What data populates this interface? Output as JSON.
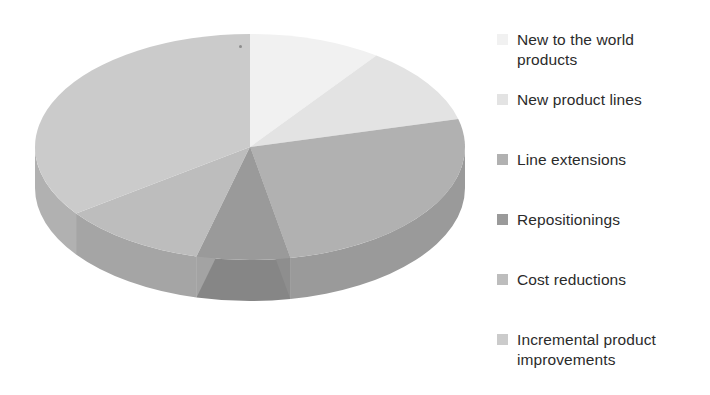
{
  "chart_data": {
    "type": "pie",
    "title": "",
    "subtitle": "",
    "xlabel": "",
    "ylabel": "",
    "style": "3d-exploded-disc",
    "legend_position": "right",
    "grid": false,
    "categories": [
      "New to the world products",
      "New product lines",
      "Line extensions",
      "Repositionings",
      "Cost reductions",
      "Incremental product improvements"
    ],
    "values": [
      10,
      11,
      26,
      7,
      11,
      35
    ],
    "units": "percent",
    "colors": [
      "#F1F1F1",
      "#E3E3E3",
      "#B1B1B1",
      "#9A9A9A",
      "#BDBDBD",
      "#CBCBCB"
    ],
    "side_colors": [
      "#D2D2D2",
      "#C6C6C6",
      "#9A9A9A",
      "#868686",
      "#A5A5A5",
      "#B1B1B1"
    ],
    "start_angle_deg": 0,
    "direction": "clockwise"
  },
  "legend": {
    "items": [
      {
        "label": "New to the world\nproducts",
        "color": "#F1F1F1",
        "swatch_name": "legend-swatch-new-to-the-world-products",
        "top": 18
      },
      {
        "label": "New product lines",
        "color": "#E3E3E3",
        "swatch_name": "legend-swatch-new-product-lines",
        "top": 78
      },
      {
        "label": "Line extensions",
        "color": "#B1B1B1",
        "swatch_name": "legend-swatch-line-extensions",
        "top": 138
      },
      {
        "label": "Repositionings",
        "color": "#9A9A9A",
        "swatch_name": "legend-swatch-repositionings",
        "top": 198
      },
      {
        "label": "Cost reductions",
        "color": "#BDBDBD",
        "swatch_name": "legend-swatch-cost-reductions",
        "top": 258
      },
      {
        "label": "Incremental product\nimprovements",
        "color": "#CBCBCB",
        "swatch_name": "legend-swatch-incremental-product-improvements",
        "top": 318
      }
    ]
  },
  "pie": {
    "center_x": 250,
    "center_y": 147,
    "radius_x": 215,
    "radius_y": 113,
    "depth": 41
  }
}
